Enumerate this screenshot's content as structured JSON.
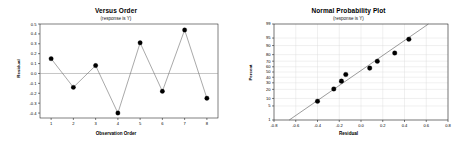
{
  "figure": {
    "background_color": "#ffffff",
    "width": 465,
    "height": 147
  },
  "panels": {
    "versus_order": {
      "title": "Versus Order",
      "subtitle": "(response is Y)",
      "xlabel": "Observation Order",
      "ylabel": "Residual"
    },
    "normal_plot": {
      "title": "Normal Probability Plot",
      "subtitle": "(response is Y)",
      "xlabel": "Residual",
      "ylabel": "Percent"
    }
  },
  "chart_data": [
    {
      "type": "line",
      "title": "Versus Order",
      "subtitle": "(response is Y)",
      "xlabel": "Observation Order",
      "ylabel": "Residual",
      "x": [
        1,
        2,
        3,
        4,
        5,
        6,
        7,
        8
      ],
      "values": [
        0.15,
        -0.14,
        0.08,
        -0.4,
        0.31,
        -0.18,
        0.44,
        -0.25
      ],
      "xlim": [
        0.5,
        8.5
      ],
      "ylim": [
        -0.45,
        0.5
      ],
      "xticks": [
        1,
        2,
        3,
        4,
        5,
        6,
        7,
        8
      ],
      "xticklabels": [
        "1",
        "2",
        "3",
        "4",
        "5",
        "6",
        "7",
        "8"
      ],
      "yticks": [
        -0.4,
        -0.3,
        -0.2,
        -0.1,
        0.0,
        0.1,
        0.2,
        0.3,
        0.4,
        0.5
      ],
      "yticklabels": [
        "-0.4",
        "-0.3",
        "-0.2",
        "-0.1",
        "0.0",
        "0.1",
        "0.2",
        "0.3",
        "0.4",
        "0.5"
      ],
      "reference_line": 0.0,
      "grid": false,
      "legend": "none",
      "marker": "filled-circle",
      "marker_color": "#000000",
      "line_color": "#6e6e6e"
    },
    {
      "type": "scatter",
      "title": "Normal Probability Plot",
      "subtitle": "(response is Y)",
      "xlabel": "Residual",
      "ylabel": "Percent",
      "x": [
        -0.4,
        -0.25,
        -0.18,
        -0.14,
        0.08,
        0.15,
        0.31,
        0.44
      ],
      "values": [
        7.8,
        20.6,
        32.9,
        45.2,
        57.5,
        69.8,
        82.1,
        94.4
      ],
      "xlim": [
        -0.8,
        0.8
      ],
      "ylim": [
        1,
        99
      ],
      "xticks": [
        -0.8,
        -0.6,
        -0.4,
        -0.2,
        0.0,
        0.2,
        0.4,
        0.6,
        0.8
      ],
      "xticklabels": [
        "-0.8",
        "-0.6",
        "-0.4",
        "-0.2",
        "0.0",
        "0.2",
        "0.4",
        "0.6",
        "0.8"
      ],
      "yticks": [
        1,
        5,
        10,
        20,
        30,
        40,
        50,
        60,
        70,
        80,
        90,
        95,
        99
      ],
      "yticklabels": [
        "1",
        "5",
        "10",
        "20",
        "30",
        "40",
        "50",
        "60",
        "70",
        "80",
        "90",
        "95",
        "99"
      ],
      "fit_line": {
        "x_start": -0.66,
        "y_start": 1,
        "x_end": 0.62,
        "y_end": 99
      },
      "grid": true,
      "grid_color": "#d8d8d8",
      "legend": "none",
      "marker": "filled-circle",
      "marker_color": "#000000",
      "probability_scale": true
    }
  ]
}
